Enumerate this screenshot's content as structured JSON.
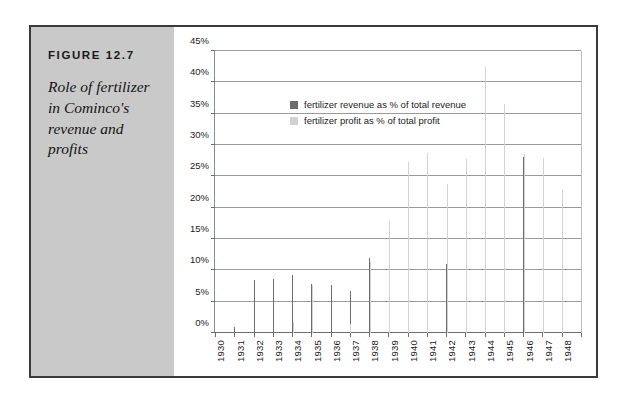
{
  "figure": {
    "label": "FIGURE 12.7",
    "caption": "Role of fertilizer in Cominco's revenue and profits"
  },
  "legend": {
    "items": [
      {
        "key": "revenue",
        "label": "fertilizer revenue as % of total revenue",
        "color": "#6d6d6d"
      },
      {
        "key": "profit",
        "label": "fertilizer profit as % of total profit",
        "color": "#d2d2d2"
      }
    ]
  },
  "chart_data": {
    "type": "bar",
    "title": "Role of fertilizer in Cominco's revenue and profits",
    "xlabel": "",
    "ylabel": "",
    "ylim": [
      0,
      45
    ],
    "ytick_step": 5,
    "ytick_labels": [
      "0%",
      "5%",
      "10%",
      "15%",
      "20%",
      "25%",
      "30%",
      "35%",
      "40%",
      "45%"
    ],
    "grid": true,
    "legend_position": "inside-top-left",
    "categories": [
      "1930",
      "1931",
      "1932",
      "1933",
      "1934",
      "1935",
      "1936",
      "1937",
      "1938",
      "1939",
      "1940",
      "1941",
      "1942",
      "1943",
      "1944",
      "1945",
      "1946",
      "1947",
      "1948"
    ],
    "series": [
      {
        "name": "fertilizer revenue as % of total revenue",
        "color": "#6d6d6d",
        "values": [
          0,
          1.0,
          8.5,
          8.6,
          9.2,
          7.8,
          7.6,
          6.7,
          12.0,
          13.0,
          13.4,
          10.9,
          11.0,
          17.8,
          31.5,
          29.8,
          28.1,
          25.8,
          21.1
        ]
      },
      {
        "name": "fertilizer profit as % of total profit",
        "color": "#d2d2d2",
        "values": [
          0,
          0,
          0,
          0,
          1.8,
          7.7,
          0,
          1.5,
          11.4,
          17.9,
          27.3,
          28.7,
          23.8,
          27.7,
          42.4,
          36.6,
          28.6,
          27.9,
          22.8
        ]
      }
    ]
  }
}
